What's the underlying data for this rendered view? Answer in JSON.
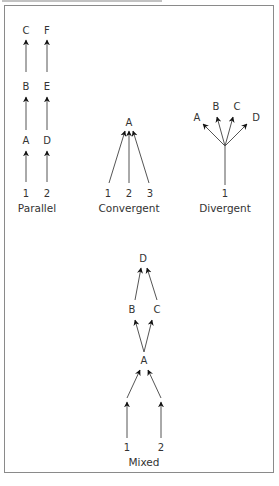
{
  "figure": {
    "caption_text": "",
    "colors": {
      "frame": "#8a8a8a",
      "edge": "#555555",
      "arrowhead": "#111111",
      "text": "#333333"
    }
  },
  "panels": {
    "parallel": {
      "caption": "Parallel",
      "sources": [
        "1",
        "2"
      ],
      "chain_1": [
        "A",
        "B",
        "C"
      ],
      "chain_2": [
        "D",
        "E",
        "F"
      ]
    },
    "convergent": {
      "caption": "Convergent",
      "sources": [
        "1",
        "2",
        "3"
      ],
      "target": "A"
    },
    "divergent": {
      "caption": "Divergent",
      "source": "1",
      "targets": [
        "A",
        "B",
        "C",
        "D"
      ]
    },
    "mixed": {
      "caption": "Mixed",
      "sources": [
        "1",
        "2"
      ],
      "hub": "A",
      "branches": [
        "B",
        "C"
      ],
      "sink": "D"
    }
  }
}
